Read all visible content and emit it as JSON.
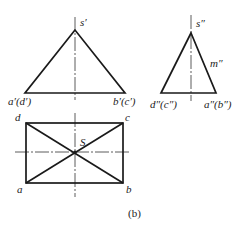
{
  "figure": {
    "caption": "(b)",
    "front_view": {
      "labels": {
        "apex": "s′",
        "left_base": "a′(d′)",
        "right_base": "b′(c′)"
      }
    },
    "side_view": {
      "labels": {
        "apex": "s″",
        "edge_point": "m″",
        "left_base": "d″(c″)",
        "right_base": "a″(b″)"
      }
    },
    "top_view": {
      "labels": {
        "top_left": "d",
        "top_right": "c",
        "bottom_left": "a",
        "bottom_right": "b",
        "apex": "S"
      }
    }
  }
}
